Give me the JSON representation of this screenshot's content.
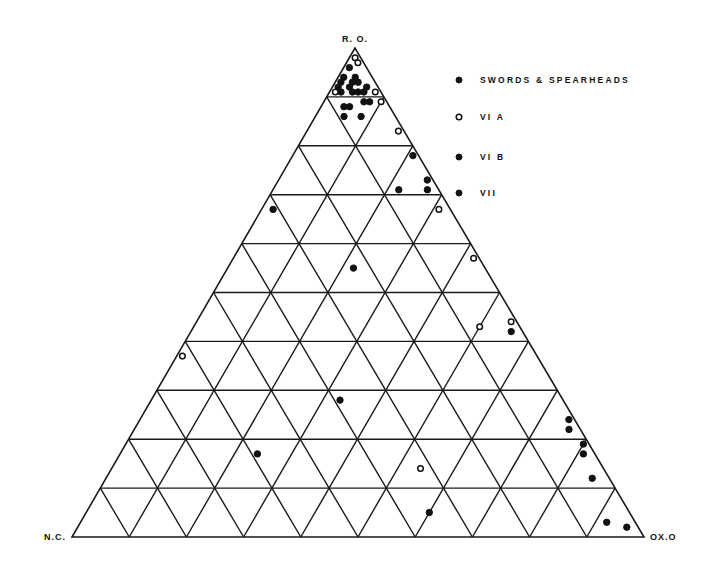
{
  "diagram": {
    "type": "ternary",
    "vertices": {
      "top": "R. O.",
      "left": "N.C.",
      "right": "OX.O"
    },
    "grid_divisions": 10,
    "colors": {
      "ink": "#111111",
      "background": "#ffffff"
    }
  },
  "legend": [
    {
      "marker": "filled",
      "label": "SWORDS & SPEARHEADS"
    },
    {
      "marker": "open",
      "label": "VI A"
    },
    {
      "marker": "filled",
      "label": "VI B"
    },
    {
      "marker": "filled",
      "label": "VII"
    }
  ],
  "chart_data": {
    "type": "scatter",
    "subtype": "ternary",
    "title": "",
    "axes": [
      "R.O.",
      "N.C.",
      "OX.O"
    ],
    "units": "percent",
    "grid": true,
    "legend_position": "top-right",
    "legend": [
      "SWORDS & SPEARHEADS",
      "VI A",
      "VI B",
      "VII"
    ],
    "points": [
      {
        "ro": 98,
        "ox": 1,
        "nc": 1,
        "marker": "open"
      },
      {
        "ro": 97,
        "ox": 2,
        "nc": 1,
        "marker": "open"
      },
      {
        "ro": 96,
        "ox": 1,
        "nc": 3,
        "marker": "filled"
      },
      {
        "ro": 94,
        "ox": 1,
        "nc": 5,
        "marker": "filled"
      },
      {
        "ro": 94,
        "ox": 3,
        "nc": 3,
        "marker": "filled"
      },
      {
        "ro": 93,
        "ox": 1,
        "nc": 6,
        "marker": "filled"
      },
      {
        "ro": 93,
        "ox": 3,
        "nc": 4,
        "marker": "filled"
      },
      {
        "ro": 93,
        "ox": 4,
        "nc": 3,
        "marker": "filled"
      },
      {
        "ro": 92,
        "ox": 1,
        "nc": 7,
        "marker": "filled"
      },
      {
        "ro": 92,
        "ox": 3,
        "nc": 5,
        "marker": "filled"
      },
      {
        "ro": 91,
        "ox": 5,
        "nc": 4,
        "marker": "filled"
      },
      {
        "ro": 92,
        "ox": 6,
        "nc": 2,
        "marker": "filled"
      },
      {
        "ro": 91,
        "ox": 2,
        "nc": 7,
        "marker": "filled"
      },
      {
        "ro": 91,
        "ox": 4,
        "nc": 5,
        "marker": "filled"
      },
      {
        "ro": 91,
        "ox": 6,
        "nc": 3,
        "marker": "filled"
      },
      {
        "ro": 91,
        "ox": 1,
        "nc": 8,
        "marker": "open"
      },
      {
        "ro": 91,
        "ox": 8,
        "nc": 1,
        "marker": "open"
      },
      {
        "ro": 88,
        "ox": 4,
        "nc": 8,
        "marker": "filled"
      },
      {
        "ro": 88,
        "ox": 5,
        "nc": 7,
        "marker": "filled"
      },
      {
        "ro": 89,
        "ox": 7,
        "nc": 4,
        "marker": "filled"
      },
      {
        "ro": 89,
        "ox": 8,
        "nc": 3,
        "marker": "filled"
      },
      {
        "ro": 89,
        "ox": 10,
        "nc": 1,
        "marker": "open"
      },
      {
        "ro": 86,
        "ox": 5,
        "nc": 9,
        "marker": "filled"
      },
      {
        "ro": 86,
        "ox": 8,
        "nc": 6,
        "marker": "filled"
      },
      {
        "ro": 83,
        "ox": 16,
        "nc": 1,
        "marker": "open"
      },
      {
        "ro": 78,
        "ox": 21,
        "nc": 1,
        "marker": "filled"
      },
      {
        "ro": 71,
        "ox": 22,
        "nc": 7,
        "marker": "filled"
      },
      {
        "ro": 73,
        "ox": 26,
        "nc": 1,
        "marker": "filled"
      },
      {
        "ro": 71,
        "ox": 27,
        "nc": 2,
        "marker": "filled"
      },
      {
        "ro": 67,
        "ox": 31,
        "nc": 2,
        "marker": "open"
      },
      {
        "ro": 67,
        "ox": 2,
        "nc": 31,
        "marker": "filled"
      },
      {
        "ro": 55,
        "ox": 22,
        "nc": 23,
        "marker": "filled"
      },
      {
        "ro": 57,
        "ox": 42,
        "nc": 1,
        "marker": "open"
      },
      {
        "ro": 44,
        "ox": 55,
        "nc": 1,
        "marker": "open"
      },
      {
        "ro": 43,
        "ox": 50,
        "nc": 7,
        "marker": "open"
      },
      {
        "ro": 42,
        "ox": 56,
        "nc": 2,
        "marker": "filled"
      },
      {
        "ro": 37,
        "ox": 1,
        "nc": 62,
        "marker": "open"
      },
      {
        "ro": 28,
        "ox": 33,
        "nc": 39,
        "marker": "filled"
      },
      {
        "ro": 24,
        "ox": 75,
        "nc": 1,
        "marker": "filled"
      },
      {
        "ro": 22,
        "ox": 76,
        "nc": 2,
        "marker": "filled"
      },
      {
        "ro": 19,
        "ox": 80,
        "nc": 1,
        "marker": "filled"
      },
      {
        "ro": 17,
        "ox": 81,
        "nc": 2,
        "marker": "filled"
      },
      {
        "ro": 17,
        "ox": 24,
        "nc": 59,
        "marker": "filled"
      },
      {
        "ro": 14,
        "ox": 54,
        "nc": 32,
        "marker": "open"
      },
      {
        "ro": 12,
        "ox": 85,
        "nc": 3,
        "marker": "filled"
      },
      {
        "ro": 5,
        "ox": 60,
        "nc": 35,
        "marker": "filled"
      },
      {
        "ro": 3,
        "ox": 92,
        "nc": 5,
        "marker": "filled"
      },
      {
        "ro": 2,
        "ox": 96,
        "nc": 2,
        "marker": "filled"
      }
    ]
  }
}
